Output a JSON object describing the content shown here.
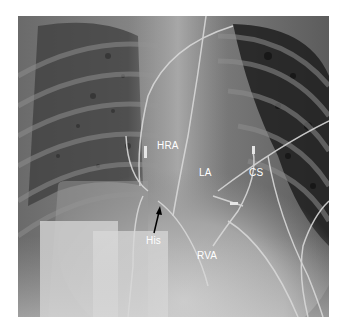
{
  "figure": {
    "type": "chest-fluoroscopy",
    "labels": [
      {
        "id": "hra",
        "text": "HRA",
        "x": 157,
        "y": 141
      },
      {
        "id": "la",
        "text": "LA",
        "x": 199,
        "y": 168
      },
      {
        "id": "cs",
        "text": "CS",
        "x": 249,
        "y": 168
      },
      {
        "id": "his",
        "text": "His",
        "x": 146,
        "y": 236
      },
      {
        "id": "rva",
        "text": "RVA",
        "x": 197,
        "y": 251
      }
    ],
    "arrow": {
      "target": "His",
      "from": [
        154,
        233
      ],
      "to": [
        160,
        207
      ],
      "color": "#000000"
    }
  }
}
